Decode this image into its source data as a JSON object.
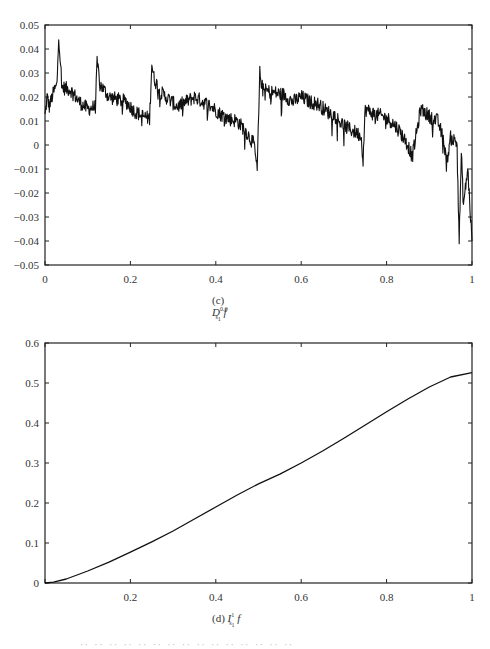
{
  "chart_data": [
    {
      "id": "c",
      "type": "line",
      "title": "",
      "caption_prefix": "(c)",
      "caption_op": "D",
      "caption_sup": "0.6",
      "caption_sub": "s1",
      "caption_func": "f",
      "xlabel": "",
      "ylabel": "",
      "xlim": [
        0,
        1
      ],
      "ylim": [
        -0.05,
        0.05
      ],
      "xticks": [
        0,
        0.2,
        0.4,
        0.6,
        0.8,
        1
      ],
      "xtick_labels": [
        "0",
        "0.2",
        "0.4",
        "0.6",
        "0.8",
        "1"
      ],
      "yticks": [
        0.05,
        0.04,
        0.03,
        0.02,
        0.01,
        0,
        -0.01,
        -0.02,
        -0.03,
        -0.04,
        -0.05
      ],
      "ytick_labels": [
        "0.05",
        "0.04",
        "0.03",
        "0.02",
        "0.01",
        "0",
        "-0.01",
        "-0.02",
        "-0.03",
        "-0.04",
        "-0.05"
      ],
      "grid": false,
      "description": "Highly irregular fractal-like signal with sharp upward jumps near x=0.03, 0.125, 0.25, 0.5 and gradual decay, trending downward toward x=1",
      "series": [
        {
          "name": "D_s1^0.6 f",
          "x": [
            0,
            0.005,
            0.01,
            0.02,
            0.028,
            0.032,
            0.04,
            0.06,
            0.08,
            0.1,
            0.118,
            0.122,
            0.13,
            0.15,
            0.17,
            0.19,
            0.21,
            0.23,
            0.245,
            0.25,
            0.255,
            0.27,
            0.29,
            0.31,
            0.33,
            0.35,
            0.37,
            0.39,
            0.41,
            0.43,
            0.45,
            0.47,
            0.49,
            0.497,
            0.503,
            0.51,
            0.53,
            0.56,
            0.58,
            0.6,
            0.62,
            0.64,
            0.66,
            0.68,
            0.7,
            0.72,
            0.74,
            0.745,
            0.75,
            0.77,
            0.79,
            0.81,
            0.83,
            0.85,
            0.86,
            0.87,
            0.88,
            0.9,
            0.92,
            0.935,
            0.94,
            0.95,
            0.965,
            0.97,
            0.975,
            0.98,
            0.99,
            1.0
          ],
          "y": [
            0.012,
            0.02,
            0.016,
            0.022,
            0.025,
            0.046,
            0.024,
            0.023,
            0.018,
            0.015,
            0.016,
            0.034,
            0.025,
            0.02,
            0.019,
            0.018,
            0.014,
            0.012,
            0.011,
            0.034,
            0.028,
            0.022,
            0.019,
            0.016,
            0.018,
            0.02,
            0.018,
            0.016,
            0.013,
            0.011,
            0.01,
            0.006,
            0.0,
            -0.011,
            0.03,
            0.023,
            0.022,
            0.021,
            0.018,
            0.02,
            0.018,
            0.017,
            0.014,
            0.012,
            0.008,
            0.006,
            0.004,
            -0.006,
            0.015,
            0.013,
            0.012,
            0.01,
            0.006,
            0.0,
            -0.005,
            0.005,
            0.015,
            0.012,
            0.01,
            0.001,
            -0.008,
            0.003,
            0.001,
            -0.04,
            -0.004,
            -0.025,
            -0.01,
            -0.04
          ]
        }
      ]
    },
    {
      "id": "d",
      "type": "line",
      "title": "",
      "caption_prefix": "(d)",
      "caption_op": "I",
      "caption_sup": "1",
      "caption_sub": "s1",
      "caption_func": "f",
      "xlabel": "",
      "ylabel": "",
      "xlim": [
        0,
        1
      ],
      "ylim": [
        0,
        0.6
      ],
      "xticks": [
        0,
        0.2,
        0.4,
        0.6,
        0.8,
        1
      ],
      "xtick_labels": [
        "",
        "0.2",
        "0.4",
        "0.6",
        "0.8",
        "1"
      ],
      "yticks": [
        0.6,
        0.5,
        0.4,
        0.3,
        0.2,
        0.1,
        0
      ],
      "ytick_labels": [
        "0.6",
        "0.5",
        "0.4",
        "0.3",
        "0.2",
        "0.1",
        "0"
      ],
      "grid": false,
      "series": [
        {
          "name": "I_s1^1 f",
          "x": [
            0,
            0.02,
            0.05,
            0.1,
            0.15,
            0.2,
            0.25,
            0.3,
            0.35,
            0.4,
            0.45,
            0.5,
            0.55,
            0.6,
            0.65,
            0.7,
            0.75,
            0.8,
            0.85,
            0.9,
            0.95,
            1.0
          ],
          "y": [
            0,
            0.002,
            0.01,
            0.03,
            0.052,
            0.077,
            0.103,
            0.13,
            0.16,
            0.19,
            0.22,
            0.248,
            0.272,
            0.3,
            0.33,
            0.362,
            0.395,
            0.428,
            0.46,
            0.49,
            0.515,
            0.526
          ]
        }
      ]
    }
  ],
  "figure_caption": "·· ·· ·· ·· ·· ·· ·· ·· ·· ·· ·· ·· ·· ·· ··"
}
